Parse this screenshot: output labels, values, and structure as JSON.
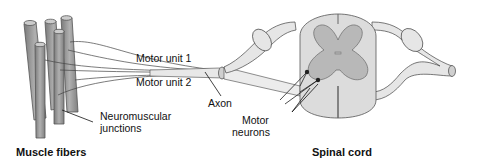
{
  "diagram": {
    "labels": {
      "motor_unit_1": "Motor unit 1",
      "motor_unit_2": "Motor unit 2",
      "axon": "Axon",
      "neuromuscular_line1": "Neuromuscular",
      "neuromuscular_line2": "junctions",
      "motor_neurons_line1": "Motor",
      "motor_neurons_line2": "neurons",
      "muscle_fibers": "Muscle fibers",
      "spinal_cord": "Spinal cord"
    },
    "colors": {
      "fiber_fill": "#9a9a9a",
      "fiber_stroke": "#555555",
      "gray_matter": "#b8b8b8",
      "white_matter": "#dcdcdc",
      "nerve_fill": "#e6e6e6",
      "line": "#222222"
    }
  }
}
